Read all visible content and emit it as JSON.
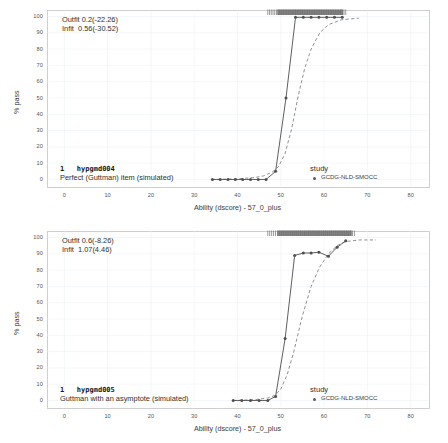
{
  "figure": {
    "panel_count": 2,
    "legend": {
      "title": "study",
      "entries": [
        {
          "label": "GCDG-NLD-SMOCC",
          "marker": "point-marker",
          "color": "#5b5b5b"
        }
      ]
    },
    "axes": {
      "xlabel": "Ability (dscore) - 57_0_plus",
      "ylabel": "% pass",
      "xticks": [
        0,
        10,
        20,
        30,
        40,
        50,
        60,
        70,
        80
      ],
      "yticks": [
        0,
        10,
        20,
        30,
        40,
        50,
        60,
        70,
        80,
        90,
        100
      ],
      "xlim": [
        -4,
        84
      ],
      "ylim": [
        -4,
        104
      ]
    },
    "colors": {
      "observed": "#555555",
      "model": "#8a8a8a",
      "grid": "#e9eef2",
      "frame": "#cfcfcf"
    }
  },
  "chart_data": [
    {
      "type": "line",
      "title": "",
      "panel_index": 0,
      "item_number": "1",
      "item_id": "hypgmd004",
      "item_label": "Perfect (Guttman) item (simulated)",
      "fit": {
        "outfit_label": "Outfit 0.2(-22.26)",
        "infit_label": "Infit  0.56(-30.52)",
        "outfit": 0.2,
        "outfit_t": -22.26,
        "infit": 0.56,
        "infit_t": -30.52
      },
      "xlabel": "Ability (dscore) - 57_0_plus",
      "ylabel": "% pass",
      "xlim": [
        -4,
        84
      ],
      "ylim": [
        -4,
        104
      ],
      "grid": true,
      "legend_position": "inside-bottom-right",
      "series": [
        {
          "name": "GCDG-NLD-SMOCC observed",
          "style": "solid-with-points",
          "x": [
            34.2,
            36.0,
            37.8,
            39.5,
            41.2,
            43.0,
            44.8,
            46.6,
            48.8,
            51.2,
            53.4,
            55.2,
            57.0,
            58.8,
            60.6,
            62.4,
            64.2
          ],
          "y": [
            0,
            0,
            0,
            0,
            0,
            0,
            0,
            0,
            5,
            50,
            99.5,
            99.5,
            99.5,
            99.5,
            99.5,
            99.5,
            99.5
          ]
        },
        {
          "name": "model (expected)",
          "style": "dashed",
          "x": [
            34,
            40,
            44,
            46,
            48,
            49.5,
            51,
            52.5,
            54,
            55.5,
            57,
            59,
            61,
            64,
            68
          ],
          "y": [
            0,
            0.4,
            1.2,
            2.2,
            4.5,
            8,
            16,
            31,
            51,
            68,
            80,
            90,
            95,
            98,
            99
          ]
        }
      ],
      "rug": {
        "name": "ability-distribution-rug",
        "x_start": 47.0,
        "x_end": 65.0,
        "y": 104
      }
    },
    {
      "type": "line",
      "title": "",
      "panel_index": 1,
      "item_number": "1",
      "item_id": "hypgmd005",
      "item_label": "Guttman with an asymptote (simulated)",
      "fit": {
        "outfit_label": "Outfit 0.6(-8.26)",
        "infit_label": "Infit  1.07(4.46)",
        "outfit": 0.6,
        "outfit_t": -8.26,
        "infit": 1.07,
        "infit_t": 4.46
      },
      "xlabel": "Ability (dscore) - 57_0_plus",
      "ylabel": "% pass",
      "xlim": [
        -4,
        84
      ],
      "ylim": [
        -4,
        104
      ],
      "grid": true,
      "legend_position": "inside-bottom-right",
      "series": [
        {
          "name": "GCDG-NLD-SMOCC observed",
          "style": "solid-with-points",
          "x": [
            39.0,
            41.0,
            43.0,
            45.0,
            47.0,
            48.8,
            51.0,
            53.2,
            55.2,
            57.0,
            58.8,
            61.0,
            63.0,
            65.0
          ],
          "y": [
            0,
            0,
            0,
            0,
            0,
            2.5,
            38,
            89,
            90.5,
            90.5,
            91,
            88.5,
            94,
            98
          ]
        },
        {
          "name": "model (expected)",
          "style": "dashed",
          "x": [
            39,
            44,
            47,
            48.5,
            50,
            51.5,
            53,
            55,
            57,
            59,
            61,
            63,
            65,
            68,
            72
          ],
          "y": [
            0,
            0.5,
            1.5,
            3,
            7,
            16,
            30,
            52,
            70,
            82,
            90,
            95,
            97.5,
            98.5,
            98.5
          ]
        }
      ],
      "rug": {
        "name": "ability-distribution-rug",
        "x_start": 47.0,
        "x_end": 67.0,
        "y": 104
      }
    }
  ]
}
